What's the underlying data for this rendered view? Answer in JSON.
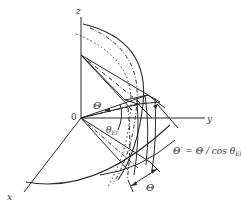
{
  "diagram": {
    "type": "3d-geometry-beam-angles",
    "axes": {
      "x_label": "x",
      "y_label": "y",
      "z_label": "z",
      "origin_label": "0"
    },
    "angle_labels": {
      "theta_upper": "Θ",
      "theta_el": "θ",
      "theta_el_sub": "El",
      "theta_lower": "Θ"
    },
    "formula": {
      "lhs": "Θ′",
      "eq": " = Θ / cos θ",
      "sub": "El"
    },
    "colors": {
      "line": "#2a2a2a",
      "text": "#333333",
      "background": "#ffffff"
    }
  }
}
